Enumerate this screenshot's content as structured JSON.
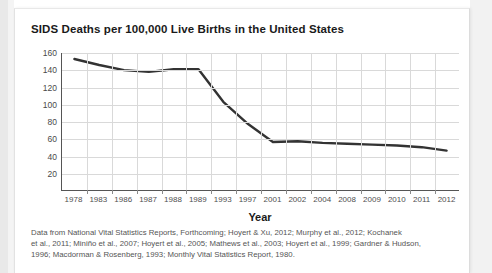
{
  "card": {
    "title": "SIDS Deaths per 100,000 Live Births in the United States"
  },
  "chart_data": {
    "type": "line",
    "title": "SIDS Deaths per 100,000 Live Births in the United States",
    "xlabel": "Year",
    "ylabel": "",
    "categories": [
      "1978",
      "1983",
      "1986",
      "1987",
      "1988",
      "1989",
      "1993",
      "1997",
      "2001",
      "2002",
      "2004",
      "2008",
      "2009",
      "2010",
      "2011",
      "2012"
    ],
    "values": [
      153,
      146,
      140,
      138,
      141,
      141,
      103,
      77,
      56,
      57,
      55,
      54,
      53,
      52,
      50,
      46
    ],
    "ylim": [
      0,
      160
    ],
    "yticks": [
      20,
      40,
      60,
      80,
      100,
      120,
      140,
      160
    ],
    "ytick_labels": [
      "20",
      "40",
      "60",
      "80",
      "100",
      "120",
      "140",
      "160"
    ],
    "grid": true,
    "legend": false,
    "line_color": "#333333"
  },
  "source": {
    "line1": "Data from National Vital Statistics Reports, Forthcoming; Hoyert & Xu, 2012; Murphy et al., 2012; Kochanek",
    "line2": "et al., 2011; Miniño et al., 2007; Hoyert et al., 2005; Mathews et al., 2003; Hoyert et al., 1999; Gardner & Hudson,",
    "line3": "1996; Macdorman & Rosenberg, 1993; Monthly Vital Statistics Report, 1980."
  }
}
